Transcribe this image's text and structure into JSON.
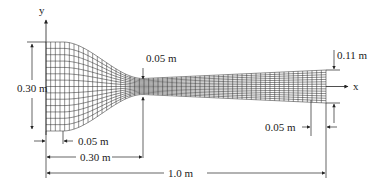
{
  "diagram": {
    "type": "nozzle-mesh-geometry",
    "axes": {
      "x_label": "x",
      "y_label": "y"
    },
    "dimensions": {
      "inlet_height": "0.30 m",
      "throat_height": "0.05 m",
      "outlet_height": "0.11 m",
      "inlet_straight_length": "0.05 m",
      "throat_position": "0.30 m",
      "outlet_straight_length": "0.05 m",
      "total_length": "1.0 m"
    },
    "mesh": {
      "axial_lines": 60,
      "radial_lines": 14
    },
    "colors": {
      "line": "#222222",
      "mesh": "#333333",
      "background": "#ffffff"
    }
  }
}
